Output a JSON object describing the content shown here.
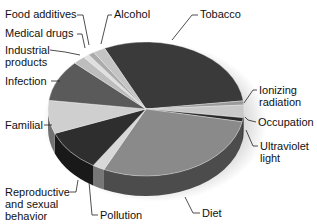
{
  "chart_data": {
    "type": "pie",
    "style": "3d",
    "title": "",
    "legend": "none (leader-line labels)",
    "slices": [
      {
        "label": "Tobacco",
        "value": 30,
        "color": "#3a3a3a"
      },
      {
        "label": "Ionizing radiation",
        "value": 1,
        "color": "#9a9a9a"
      },
      {
        "label": "Occupation",
        "value": 3,
        "color": "#c8c8c8"
      },
      {
        "label": "Ultraviolet light",
        "value": 1,
        "color": "#2a2a2a"
      },
      {
        "label": "Diet",
        "value": 29,
        "color": "#8a8a8a"
      },
      {
        "label": "Pollution",
        "value": 2,
        "color": "#d8d8d8"
      },
      {
        "label": "Reproductive and sexual behavior",
        "value": 10,
        "color": "#2e2e2e"
      },
      {
        "label": "Familial",
        "value": 8,
        "color": "#cfcfcf"
      },
      {
        "label": "Infection",
        "value": 10,
        "color": "#5a5a5a"
      },
      {
        "label": "Industrial products",
        "value": 2,
        "color": "#bdbdbd"
      },
      {
        "label": "Medical drugs",
        "value": 1,
        "color": "#e0e0e0"
      },
      {
        "label": "Food additives",
        "value": 1,
        "color": "#ababab"
      },
      {
        "label": "Alcohol",
        "value": 2,
        "color": "#c4c4c4"
      }
    ],
    "start_angle_deg": -115
  },
  "labels": {
    "food_additives": "Food additives",
    "alcohol": "Alcohol",
    "tobacco": "Tobacco",
    "medical_drugs": "Medical drugs",
    "industrial_products": "Industrial products",
    "infection": "Infection",
    "ionizing_radiation": "Ionizing radiation",
    "occupation": "Occupation",
    "familial": "Familial",
    "ultraviolet_light": "Ultraviolet light",
    "reproductive": "Reproductive and sexual behavior",
    "pollution": "Pollution",
    "diet": "Diet"
  }
}
